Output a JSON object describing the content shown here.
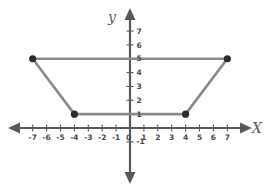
{
  "figure": {
    "title": "",
    "axis_labels": {
      "x": "X",
      "y": "y"
    },
    "colors": {
      "axis": "#5a5a5a",
      "shape_stroke": "#8a8a8a",
      "vertex": "#2b2b2b",
      "tick_text": "#4a4a4a",
      "background": "#ffffff"
    }
  },
  "chart_data": {
    "type": "scatter",
    "title": "",
    "xlabel": "X",
    "ylabel": "y",
    "xlim": [
      -7.9,
      7.9
    ],
    "ylim": [
      -1.9,
      7.6
    ],
    "grid": false,
    "legend": false,
    "x_ticks": [
      -7,
      -6,
      -5,
      -4,
      -3,
      -2,
      -1,
      0,
      1,
      2,
      3,
      4,
      5,
      6,
      7
    ],
    "x_tick_labels": [
      "-7",
      "-6",
      "-5",
      "-4",
      "-3",
      "-2",
      "-1",
      "0",
      "1",
      "2",
      "3",
      "4",
      "5",
      "6",
      "7"
    ],
    "y_ticks": [
      -1,
      1,
      2,
      3,
      4,
      5,
      6,
      7
    ],
    "y_tick_labels": [
      "-1",
      "1",
      "2",
      "3",
      "4",
      "5",
      "6",
      "7"
    ],
    "series": [
      {
        "name": "trapezoid",
        "shape": "trapezoid",
        "closed": true,
        "points": [
          {
            "label": "A",
            "x": -7,
            "y": 5
          },
          {
            "label": "B",
            "x": 7,
            "y": 5
          },
          {
            "label": "C",
            "x": 4,
            "y": 1
          },
          {
            "label": "D",
            "x": -4,
            "y": 1
          }
        ]
      }
    ],
    "annotations": []
  }
}
